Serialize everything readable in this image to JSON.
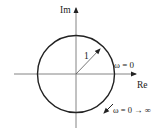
{
  "diagram": {
    "type": "nyquist-plot",
    "axes": {
      "imag_label": "Im",
      "real_label": "Re"
    },
    "circle": {
      "radius_label": "1"
    },
    "annotations": {
      "start_point": "ω = 0",
      "direction": "ω = 0 → ∞"
    },
    "colors": {
      "stroke": "#222222",
      "axis": "#666666"
    }
  }
}
